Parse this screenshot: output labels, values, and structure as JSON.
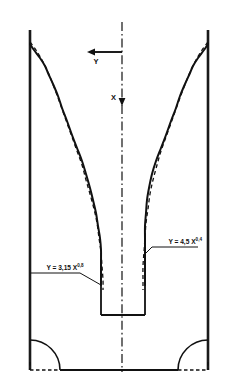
{
  "figure": {
    "kind": "engineering-scour-profile-cross-section",
    "background_color": "#ffffff",
    "line_color": "#111111"
  },
  "axes": {
    "vertical": {
      "label": "X",
      "direction": "downward",
      "name": "x-axis-downward"
    },
    "horizontal": {
      "label": "Y",
      "direction": "leftward",
      "name": "y-axis-leftward"
    },
    "centerline_style": "dash-dot"
  },
  "annotations": [
    {
      "id": "left-equation",
      "coefficient": "3,15",
      "exponent": "0,8",
      "base": "Y = 3,15 X",
      "full": "Y = 3,15 X^0,8",
      "side": "left"
    },
    {
      "id": "right-equation",
      "coefficient": "4,5",
      "exponent": "0,4",
      "base": "Y = 4,5 X",
      "full": "Y = 4,5 X^0,4",
      "side": "right"
    }
  ],
  "chart_data": {
    "type": "line",
    "title": "",
    "xlabel": "Y",
    "ylabel": "X",
    "grid": false,
    "legend": "none",
    "note": "Coordinates are in image pixel space; X increases downward from the top datum, Y is measured horizontally outward from the vertical centerline at x=122.",
    "geometry": {
      "left_wall_x": 30,
      "right_wall_x": 208,
      "wall_top_y": 30,
      "wall_bottom_y": 370,
      "centerline_x": 122,
      "bottom_y": 370,
      "notch": {
        "left_x": 100,
        "right_x": 145,
        "top_y": 285,
        "bottom_y": 315
      },
      "fillet_radius": 30
    },
    "series": [
      {
        "name": "measured-profile-left",
        "style": "solid",
        "points": [
          [
            30,
            44
          ],
          [
            34,
            50
          ],
          [
            40,
            58
          ],
          [
            45,
            66
          ],
          [
            48,
            73
          ],
          [
            53,
            84
          ],
          [
            58,
            96
          ],
          [
            62,
            108
          ],
          [
            67,
            121
          ],
          [
            72,
            135
          ],
          [
            77,
            148
          ],
          [
            82,
            161
          ],
          [
            86,
            174
          ],
          [
            90,
            188
          ],
          [
            93,
            200
          ],
          [
            96,
            213
          ],
          [
            98,
            226
          ],
          [
            100,
            238
          ],
          [
            101,
            250
          ],
          [
            101,
            262
          ],
          [
            101,
            274
          ],
          [
            101,
            285
          ]
        ]
      },
      {
        "name": "fitted-power-law-left",
        "style": "dashed",
        "equation": "Y = 3,15 X^0,8",
        "points": [
          [
            30,
            42
          ],
          [
            36,
            50
          ],
          [
            42,
            60
          ],
          [
            47,
            70
          ],
          [
            52,
            82
          ],
          [
            57,
            95
          ],
          [
            62,
            109
          ],
          [
            67,
            123
          ],
          [
            72,
            137
          ],
          [
            77,
            151
          ],
          [
            82,
            165
          ],
          [
            86,
            180
          ],
          [
            90,
            194
          ],
          [
            94,
            209
          ],
          [
            97,
            223
          ],
          [
            99,
            238
          ],
          [
            101,
            252
          ],
          [
            102,
            266
          ],
          [
            103,
            280
          ],
          [
            103,
            290
          ]
        ]
      },
      {
        "name": "measured-profile-right",
        "style": "solid",
        "points": [
          [
            208,
            44
          ],
          [
            204,
            50
          ],
          [
            198,
            58
          ],
          [
            193,
            66
          ],
          [
            190,
            73
          ],
          [
            185,
            84
          ],
          [
            180,
            96
          ],
          [
            176,
            108
          ],
          [
            171,
            121
          ],
          [
            166,
            135
          ],
          [
            161,
            148
          ],
          [
            156,
            161
          ],
          [
            152,
            174
          ],
          [
            149,
            188
          ],
          [
            147,
            200
          ],
          [
            146,
            213
          ],
          [
            145,
            226
          ],
          [
            145,
            238
          ],
          [
            145,
            250
          ],
          [
            145,
            262
          ],
          [
            145,
            274
          ],
          [
            145,
            285
          ]
        ]
      },
      {
        "name": "fitted-power-law-right",
        "style": "dashed",
        "equation": "Y = 4,5 X^0,4",
        "points": [
          [
            208,
            42
          ],
          [
            202,
            50
          ],
          [
            196,
            60
          ],
          [
            191,
            70
          ],
          [
            186,
            82
          ],
          [
            181,
            95
          ],
          [
            176,
            109
          ],
          [
            171,
            123
          ],
          [
            166,
            137
          ],
          [
            161,
            151
          ],
          [
            157,
            165
          ],
          [
            153,
            180
          ],
          [
            150,
            194
          ],
          [
            148,
            209
          ],
          [
            146,
            223
          ],
          [
            145,
            238
          ],
          [
            144,
            252
          ],
          [
            143,
            266
          ],
          [
            143,
            280
          ],
          [
            143,
            290
          ]
        ]
      }
    ]
  }
}
